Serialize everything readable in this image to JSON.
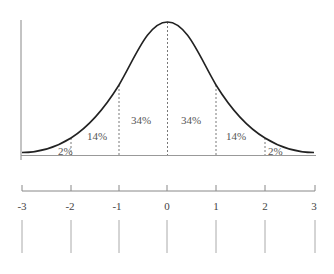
{
  "diagram": {
    "title": "",
    "type": "normal-distribution-empirical-rule",
    "regions": [
      {
        "label": "2%",
        "from": -3,
        "to": -2
      },
      {
        "label": "14%",
        "from": -2,
        "to": -1
      },
      {
        "label": "34%",
        "from": -1,
        "to": 0
      },
      {
        "label": "34%",
        "from": 0,
        "to": 1
      },
      {
        "label": "14%",
        "from": 1,
        "to": 2
      },
      {
        "label": "2%",
        "from": 2,
        "to": 3
      }
    ],
    "axis_ticks": [
      "-3",
      "-2",
      "-1",
      "0",
      "1",
      "2",
      "3"
    ],
    "colors": {
      "curve": "#222222",
      "axis": "#888888",
      "dashed": "#555555",
      "text": "#555555"
    }
  }
}
